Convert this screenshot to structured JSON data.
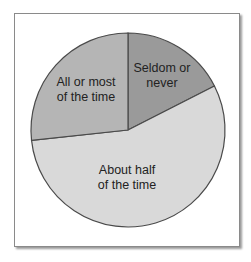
{
  "chart_data": {
    "type": "pie",
    "title": "",
    "start_angle_deg_clockwise_from_top": 0,
    "slices": [
      {
        "label": "Seldom or never",
        "value": 17.5,
        "color": "#9a9a9a"
      },
      {
        "label": "About half of the time",
        "value": 55.8,
        "color": "#d9d9d9"
      },
      {
        "label": "All or most of the time",
        "value": 26.7,
        "color": "#b5b5b5"
      }
    ],
    "legend": "none (labels inside slices)"
  },
  "labels": {
    "seldom_line1": "Seldom or",
    "seldom_line2": "never",
    "half_line1": "About half",
    "half_line2": "of the time",
    "most_line1": "All or most",
    "most_line2": "of the time"
  }
}
